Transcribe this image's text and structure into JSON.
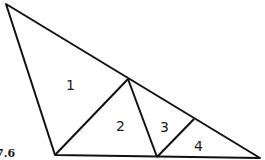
{
  "figure": {
    "caption_fragment": "7.6",
    "regions": [
      {
        "label": "1"
      },
      {
        "label": "2"
      },
      {
        "label": "3"
      },
      {
        "label": "4"
      }
    ]
  },
  "colors": {
    "stroke": "#111111",
    "background": "#ffffff"
  }
}
